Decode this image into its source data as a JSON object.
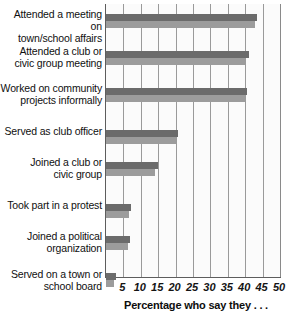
{
  "chart_data": {
    "type": "bar",
    "orientation": "horizontal",
    "title": "",
    "xlabel": "Percentage who say they . . .",
    "ylabel": "",
    "xlim": [
      0,
      50
    ],
    "xticks": [
      5,
      10,
      15,
      20,
      25,
      30,
      35,
      40,
      45,
      50
    ],
    "grid": true,
    "legend": "none",
    "categories": [
      "Attended a meeting on\ntown/school affairs",
      "Attended a club or\ncivic group meeting",
      "Worked on community\nprojects informally",
      "Served as club officer",
      "Joined a club or\ncivic group",
      "Took part in a protest",
      "Joined a political\norganization",
      "Served on a town or\nschool board"
    ],
    "series": [
      {
        "name": "series-1",
        "color": "#6b6b6b",
        "values": [
          43.5,
          41.0,
          40.5,
          20.8,
          14.8,
          7.3,
          7.0,
          3.0
        ]
      },
      {
        "name": "series-2",
        "color": "#9c9c9c",
        "values": [
          42.8,
          40.0,
          39.8,
          20.0,
          14.0,
          6.6,
          6.2,
          2.3
        ]
      }
    ]
  },
  "axis": {
    "tick_labels": [
      "5",
      "10",
      "15",
      "20",
      "25",
      "30",
      "35",
      "40",
      "45",
      "50"
    ],
    "title": "Percentage who say they . . ."
  },
  "labels": {
    "c0": "Attended a meeting on\ntown/school affairs",
    "c1": "Attended a club or\ncivic group meeting",
    "c2": "Worked on community\nprojects informally",
    "c3": "Served as club officer",
    "c4": "Joined a club or\ncivic group",
    "c5": "Took part in a protest",
    "c6": "Joined a political\norganization",
    "c7": "Served on a town or\nschool board"
  }
}
